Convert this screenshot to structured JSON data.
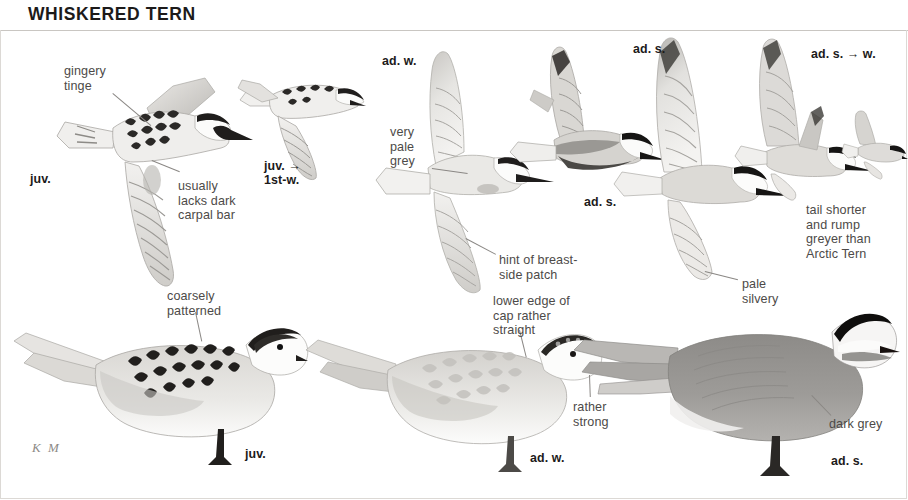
{
  "plate": {
    "title": "WHISKERED TERN",
    "artist_signature": "K M",
    "species": "Whiskered Tern",
    "background_color": "#ffffff",
    "ink_color": "#231f20",
    "annotation_color": "#4d4a48"
  },
  "age_labels": [
    {
      "id": "juv-flight",
      "text": "juv.",
      "x": 30,
      "y": 173
    },
    {
      "id": "juv-1stw-flight",
      "text": "juv. →\n1st-w.",
      "x": 264,
      "y": 160
    },
    {
      "id": "ad-w-flight",
      "text": "ad. w.",
      "x": 382,
      "y": 55
    },
    {
      "id": "ad-s-flight-left",
      "text": "ad. s.",
      "x": 584,
      "y": 196
    },
    {
      "id": "ad-s-flight-big",
      "text": "ad. s.",
      "x": 633,
      "y": 43
    },
    {
      "id": "ad-s-to-w-flight",
      "text": "ad. s. → w.",
      "x": 811,
      "y": 48
    },
    {
      "id": "juv-standing",
      "text": "juv.",
      "x": 245,
      "y": 448
    },
    {
      "id": "ad-w-standing",
      "text": "ad. w.",
      "x": 530,
      "y": 452
    },
    {
      "id": "ad-s-standing",
      "text": "ad. s.",
      "x": 831,
      "y": 455
    }
  ],
  "annotations": [
    {
      "id": "gingery-tinge",
      "text": "gingery\ntinge",
      "x": 64,
      "y": 64
    },
    {
      "id": "usually-lacks-bar",
      "text": "usually\nlacks dark\ncarpal bar",
      "x": 178,
      "y": 179
    },
    {
      "id": "very-pale-grey",
      "text": "very\npale\ngrey",
      "x": 390,
      "y": 125
    },
    {
      "id": "hint-breast-patch",
      "text": "hint of breast-\nside patch",
      "x": 499,
      "y": 253
    },
    {
      "id": "lower-edge-cap",
      "text": "lower edge of\ncap rather\nstraight",
      "x": 493,
      "y": 294
    },
    {
      "id": "coarsely-patterned",
      "text": "coarsely\npatterned",
      "x": 167,
      "y": 289
    },
    {
      "id": "pale-silvery",
      "text": "pale\nsilvery",
      "x": 742,
      "y": 277
    },
    {
      "id": "tail-shorter-rump",
      "text": "tail shorter\nand rump\ngreyer than\nArctic Tern",
      "x": 806,
      "y": 203
    },
    {
      "id": "rather-strong",
      "text": "rather\nstrong",
      "x": 573,
      "y": 400
    },
    {
      "id": "dark-grey",
      "text": "dark grey",
      "x": 829,
      "y": 417
    }
  ],
  "leaders": [
    {
      "id": "leader-gingery",
      "x": 113,
      "y": 93,
      "len": 50,
      "angle": 40
    },
    {
      "id": "leader-carpal",
      "x": 152,
      "y": 160,
      "len": 30,
      "angle": 22
    },
    {
      "id": "leader-palegrey",
      "x": 432,
      "y": 168,
      "len": 36,
      "angle": 8
    },
    {
      "id": "leader-breast",
      "x": 466,
      "y": 238,
      "len": 34,
      "angle": 28
    },
    {
      "id": "leader-lowercap",
      "x": 520,
      "y": 330,
      "len": 28,
      "angle": 76
    },
    {
      "id": "leader-coarse",
      "x": 196,
      "y": 312,
      "len": 30,
      "angle": 78
    },
    {
      "id": "leader-silvery",
      "x": 705,
      "y": 271,
      "len": 34,
      "angle": 14
    },
    {
      "id": "leader-strong",
      "x": 590,
      "y": 375,
      "len": 22,
      "angle": 88
    },
    {
      "id": "leader-darkgrey",
      "x": 812,
      "y": 395,
      "len": 28,
      "angle": 46
    }
  ],
  "birds": [
    {
      "id": "juv-flight",
      "name": "juvenile-in-flight",
      "plumage": "juvenile",
      "pose": "flight",
      "note": "ginger-tinged scalloped mantle, no dark carpal bar"
    },
    {
      "id": "juv-1stw-flight",
      "name": "juvenile-to-first-winter-flight",
      "plumage": "juv. to 1st-winter",
      "pose": "flight",
      "note": "small distant bird"
    },
    {
      "id": "ad-w-flight",
      "name": "adult-winter-in-flight",
      "plumage": "adult winter",
      "pose": "flight",
      "note": "very pale grey upperwing"
    },
    {
      "id": "ad-s-flight-left",
      "name": "adult-summer-in-flight-small",
      "plumage": "adult summer",
      "pose": "flight",
      "note": "dark grey belly, black cap"
    },
    {
      "id": "ad-s-flight-big",
      "name": "adult-summer-in-flight-large",
      "plumage": "adult summer",
      "pose": "flight",
      "note": "pale silvery underwing"
    },
    {
      "id": "ad-s-to-w-flight",
      "name": "adult-summer-to-winter-flight",
      "plumage": "adult summer to winter",
      "pose": "flight",
      "note": "moulting cap"
    },
    {
      "id": "ad-s-to-w-small",
      "name": "adult-summer-to-winter-distant",
      "plumage": "adult summer to winter",
      "pose": "flight",
      "note": "short tail, grey rump"
    },
    {
      "id": "juv-standing",
      "name": "juvenile-standing",
      "plumage": "juvenile",
      "pose": "standing",
      "note": "coarsely patterned mantle"
    },
    {
      "id": "ad-w-standing",
      "name": "adult-winter-standing",
      "plumage": "adult winter",
      "pose": "standing",
      "note": "straight lower edge of cap, strong bill"
    },
    {
      "id": "ad-s-standing",
      "name": "adult-summer-standing",
      "plumage": "adult summer",
      "pose": "standing",
      "note": "dark grey underparts, black cap, white cheek"
    }
  ]
}
